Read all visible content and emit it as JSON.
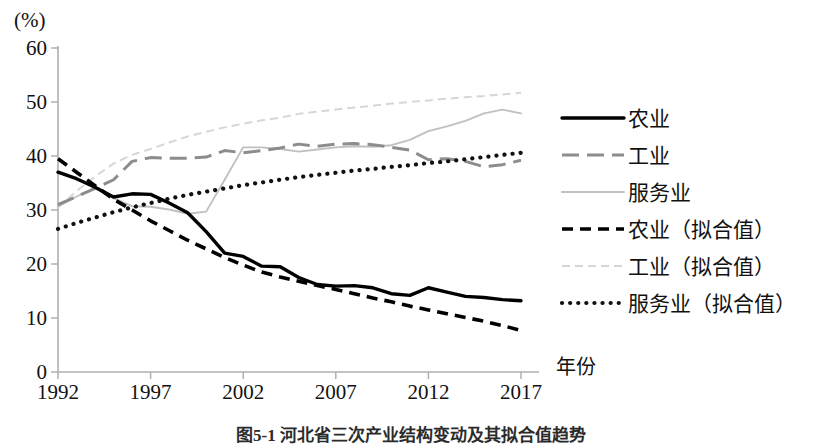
{
  "figure": {
    "unit_label": "(%)",
    "x_axis_title": "年份",
    "caption": "图5-1 河北省三次产业结构变动及其拟合值趋势"
  },
  "colors": {
    "agriculture": "#000000",
    "industry": "#8c8c8c",
    "services": "#c0c0c0",
    "agriculture_fit": "#000000",
    "industry_fit": "#d6d6d6",
    "services_fit": "#111111",
    "axis": "#b0b0b0"
  },
  "legend": {
    "items": [
      {
        "label": "农业",
        "style": "solid-thick",
        "color": "#000000"
      },
      {
        "label": "工业",
        "style": "dashed-long",
        "color": "#8c8c8c"
      },
      {
        "label": "服务业",
        "style": "solid-thin",
        "color": "#c0c0c0"
      },
      {
        "label": "农业（拟合值）",
        "style": "dashed-bold",
        "color": "#000000"
      },
      {
        "label": "工业（拟合值）",
        "style": "dashed-light",
        "color": "#d6d6d6"
      },
      {
        "label": "服务业（拟合值）",
        "style": "dotted",
        "color": "#111111"
      }
    ]
  },
  "chart_data": {
    "type": "line",
    "title": "",
    "subtitle": "",
    "xlabel": "年份",
    "ylabel": "(%)",
    "xlim": [
      1992,
      2017
    ],
    "ylim": [
      0,
      60
    ],
    "ytick_step": 10,
    "yticks": [
      0,
      10,
      20,
      30,
      40,
      50,
      60
    ],
    "xticks": [
      1992,
      1997,
      2002,
      2007,
      2012,
      2017
    ],
    "x": [
      1992,
      1993,
      1994,
      1995,
      1996,
      1997,
      1998,
      1999,
      2000,
      2001,
      2002,
      2003,
      2004,
      2005,
      2006,
      2007,
      2008,
      2009,
      2010,
      2011,
      2012,
      2013,
      2014,
      2015,
      2016,
      2017
    ],
    "grid": false,
    "legend_position": "right",
    "series": [
      {
        "name": "农业",
        "style": "solid-thick",
        "color": "#000000",
        "values": [
          37.0,
          35.8,
          34.2,
          32.4,
          33.0,
          32.9,
          31.3,
          29.5,
          26.0,
          22.0,
          21.4,
          19.6,
          19.5,
          17.5,
          16.2,
          15.9,
          16.0,
          15.6,
          14.5,
          14.2,
          15.6,
          14.8,
          14.0,
          13.8,
          13.4,
          13.2
        ]
      },
      {
        "name": "工业",
        "style": "dashed-long",
        "color": "#8c8c8c",
        "values": [
          31.0,
          32.5,
          34.0,
          35.6,
          39.0,
          39.7,
          39.6,
          39.6,
          39.8,
          41.0,
          40.6,
          41.0,
          41.5,
          42.2,
          41.8,
          42.2,
          42.3,
          42.1,
          41.6,
          41.1,
          39.3,
          39.5,
          39.0,
          38.0,
          38.4,
          39.2
        ]
      },
      {
        "name": "服务业",
        "style": "solid-thin",
        "color": "#c0c0c0",
        "values": [
          30.6,
          32.5,
          34.0,
          32.2,
          30.7,
          30.6,
          30.1,
          29.3,
          29.7,
          35.6,
          41.6,
          41.6,
          41.3,
          40.8,
          41.2,
          41.6,
          41.8,
          41.7,
          42.0,
          43.0,
          44.6,
          45.5,
          46.5,
          47.9,
          48.6,
          47.9
        ]
      },
      {
        "name": "农业（拟合值）",
        "style": "dashed-bold",
        "color": "#000000",
        "values": [
          39.5,
          37.0,
          34.5,
          32.0,
          30.0,
          28.0,
          26.2,
          24.4,
          22.8,
          21.2,
          19.8,
          18.5,
          17.6,
          16.8,
          16.0,
          15.3,
          14.5,
          13.7,
          13.0,
          12.2,
          11.5,
          10.8,
          10.1,
          9.4,
          8.6,
          7.7
        ]
      },
      {
        "name": "工业（拟合值）",
        "style": "dashed-light",
        "color": "#d6d6d6",
        "values": [
          30.5,
          33.5,
          36.2,
          38.6,
          40.2,
          41.3,
          42.5,
          43.6,
          44.5,
          45.3,
          46.0,
          46.6,
          47.1,
          47.8,
          48.2,
          48.6,
          49.0,
          49.3,
          49.7,
          50.0,
          50.3,
          50.6,
          50.9,
          51.1,
          51.4,
          51.7
        ]
      },
      {
        "name": "服务业（拟合值）",
        "style": "dotted",
        "color": "#111111",
        "values": [
          26.5,
          27.6,
          28.6,
          29.6,
          30.5,
          31.3,
          32.1,
          32.8,
          33.4,
          34.0,
          34.6,
          35.1,
          35.6,
          36.1,
          36.5,
          36.9,
          37.3,
          37.6,
          38.0,
          38.3,
          38.7,
          39.0,
          39.4,
          39.8,
          40.2,
          40.6
        ]
      }
    ]
  }
}
